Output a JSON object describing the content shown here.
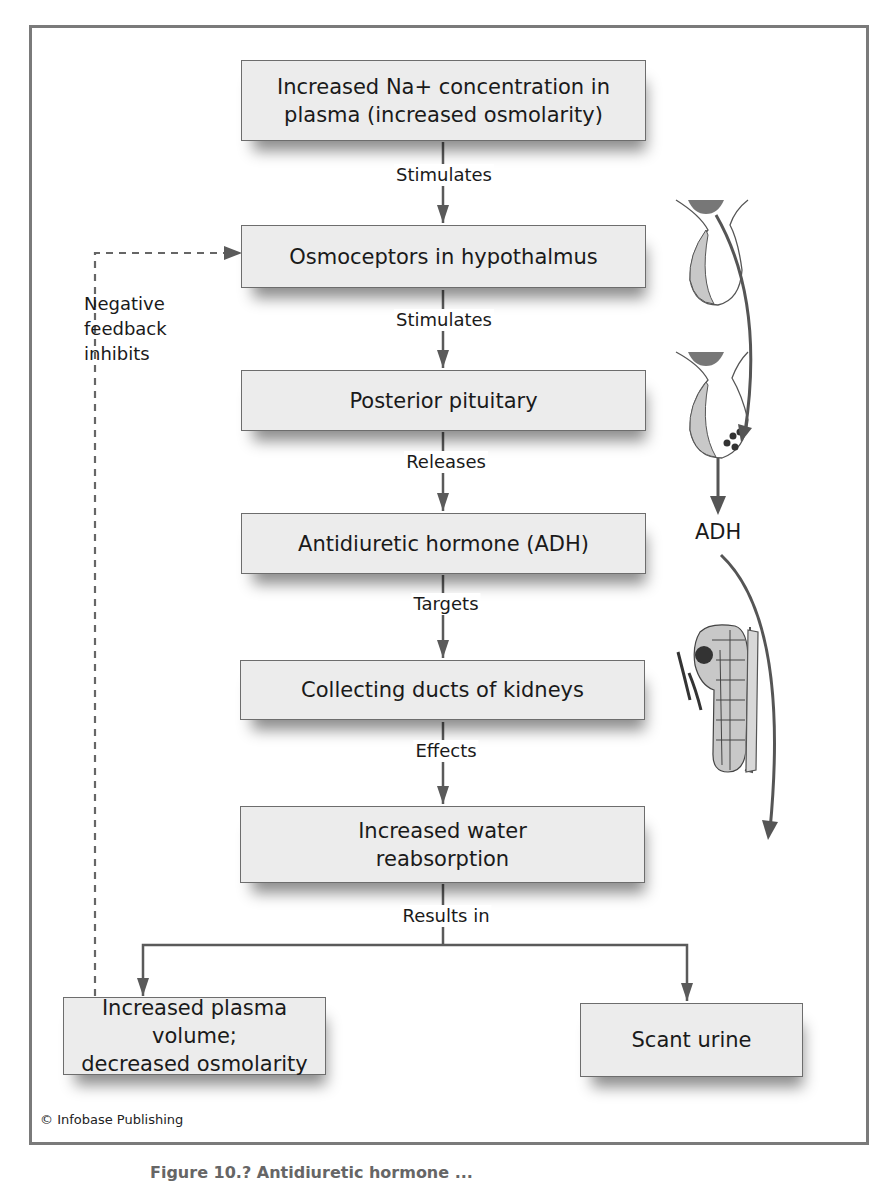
{
  "diagram": {
    "type": "flowchart",
    "boxes": [
      {
        "id": "b1",
        "text": "Increased Na+ concentration in\nplasma (increased osmolarity)"
      },
      {
        "id": "b2",
        "text": "Osmoceptors in hypothalmus"
      },
      {
        "id": "b3",
        "text": "Posterior pituitary"
      },
      {
        "id": "b4",
        "text": "Antidiuretic hormone (ADH)"
      },
      {
        "id": "b5",
        "text": "Collecting ducts of kidneys"
      },
      {
        "id": "b6",
        "text": "Increased water\nreabsorption"
      },
      {
        "id": "b7",
        "text": "Increased plasma volume;\ndecreased osmolarity"
      },
      {
        "id": "b8",
        "text": "Scant urine"
      }
    ],
    "edges": [
      {
        "from": "b1",
        "to": "b2",
        "label": "Stimulates"
      },
      {
        "from": "b2",
        "to": "b3",
        "label": "Stimulates"
      },
      {
        "from": "b3",
        "to": "b4",
        "label": "Releases"
      },
      {
        "from": "b4",
        "to": "b5",
        "label": "Targets"
      },
      {
        "from": "b5",
        "to": "b6",
        "label": "Effects"
      },
      {
        "from": "b6",
        "to": "b7",
        "label": "Results in"
      },
      {
        "from": "b6",
        "to": "b8",
        "label": "Results in"
      },
      {
        "from": "b7",
        "to": "b2",
        "label": "Negative\nfeedback\ninhibits",
        "style": "dashed"
      }
    ],
    "illustration": {
      "adh_label": "ADH",
      "parts": [
        "hypothalamus-pituitary-icon",
        "pituitary-secreting-icon",
        "kidney-nephron-icon"
      ]
    },
    "colors": {
      "box_fill": "#ececec",
      "box_border": "#6d6d6d",
      "arrow": "#5a5a5a",
      "frame": "#7a7a7a",
      "illustration_fill": "#c8c8c8",
      "illustration_dark": "#444444"
    }
  },
  "footer": {
    "credit": "© Infobase Publishing",
    "caption_partial": "Figure 10.? Antidiuretic hormone ..."
  }
}
